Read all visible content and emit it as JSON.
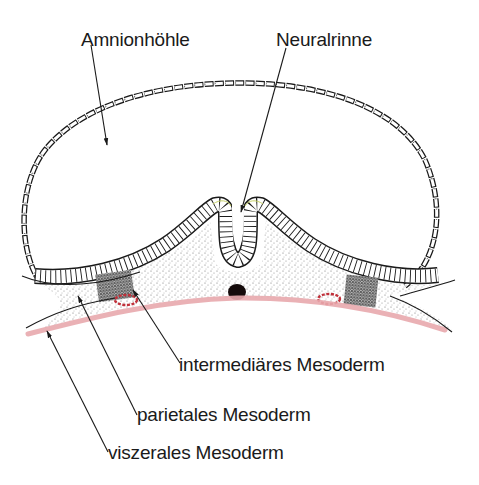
{
  "diagram": {
    "labels": {
      "amnion": "Amnionhöhle",
      "neural_groove": "Neuralrinne",
      "intermediate_mesoderm": "intermediäres Mesoderm",
      "parietal_mesoderm": "parietales Mesoderm",
      "visceral_mesoderm": "viszerales Mesoderm"
    },
    "colors": {
      "ink": "#1a1a1a",
      "pink_layer": "#e8a9ad",
      "nephrotome": "#c0303a",
      "stipple": "#6b6b6b",
      "background": "#ffffff"
    },
    "structures": [
      "amnion-epithelium",
      "neural-plate-ectoderm",
      "neural-groove",
      "paraxial-mesoderm",
      "intermediate-mesoderm",
      "lateral-plate-mesoderm",
      "notochord",
      "endoderm",
      "intermediate-mesoderm-tubule"
    ]
  }
}
